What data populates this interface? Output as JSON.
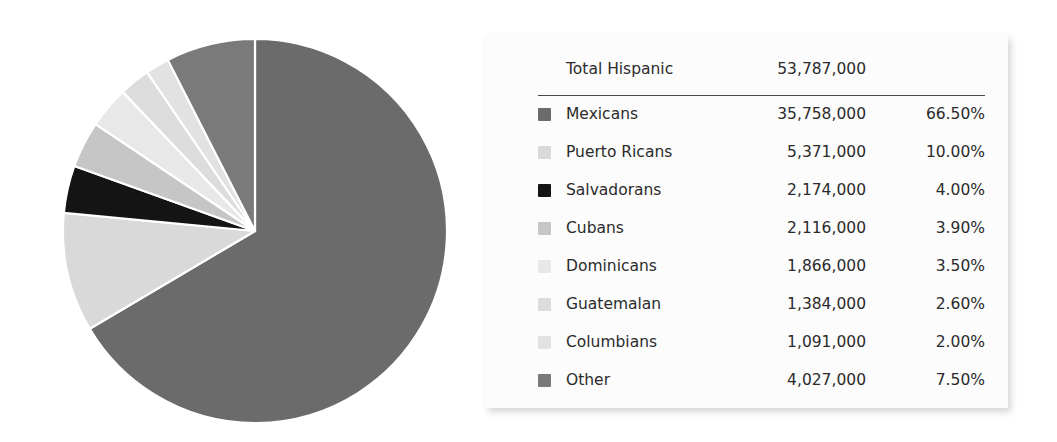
{
  "chart_data": {
    "type": "pie",
    "title": "",
    "total_label": "Total Hispanic",
    "total_value": "53,787,000",
    "legend_position": "right",
    "start_angle_deg": 0,
    "direction": "clockwise",
    "categories": [
      "Mexicans",
      "Puerto Ricans",
      "Salvadorans",
      "Cubans",
      "Dominicans",
      "Guatemalan",
      "Columbians",
      "Other"
    ],
    "values": [
      35758000,
      5371000,
      2174000,
      2116000,
      1866000,
      1384000,
      1091000,
      4027000
    ],
    "percentages": [
      66.5,
      10.0,
      4.0,
      3.9,
      3.5,
      2.6,
      2.0,
      7.5
    ],
    "colors": [
      "#6b6b6b",
      "#d9d9d9",
      "#141414",
      "#c6c6c6",
      "#e8e8e8",
      "#dcdcdc",
      "#e2e2e2",
      "#7a7a7a"
    ],
    "slice_border_color": "#ffffff"
  },
  "legend": {
    "header": {
      "label": "Total Hispanic",
      "value": "53,787,000",
      "percent": ""
    },
    "rows": [
      {
        "label": "Mexicans",
        "value": "35,758,000",
        "percent": "66.50%",
        "color": "#6b6b6b"
      },
      {
        "label": "Puerto Ricans",
        "value": "5,371,000",
        "percent": "10.00%",
        "color": "#d9d9d9"
      },
      {
        "label": "Salvadorans",
        "value": "2,174,000",
        "percent": "4.00%",
        "color": "#141414"
      },
      {
        "label": "Cubans",
        "value": "2,116,000",
        "percent": "3.90%",
        "color": "#c6c6c6"
      },
      {
        "label": "Dominicans",
        "value": "1,866,000",
        "percent": "3.50%",
        "color": "#e8e8e8"
      },
      {
        "label": "Guatemalan",
        "value": "1,384,000",
        "percent": "2.60%",
        "color": "#dcdcdc"
      },
      {
        "label": "Columbians",
        "value": "1,091,000",
        "percent": "2.00%",
        "color": "#e2e2e2"
      },
      {
        "label": "Other",
        "value": "4,027,000",
        "percent": "7.50%",
        "color": "#7a7a7a"
      }
    ]
  }
}
